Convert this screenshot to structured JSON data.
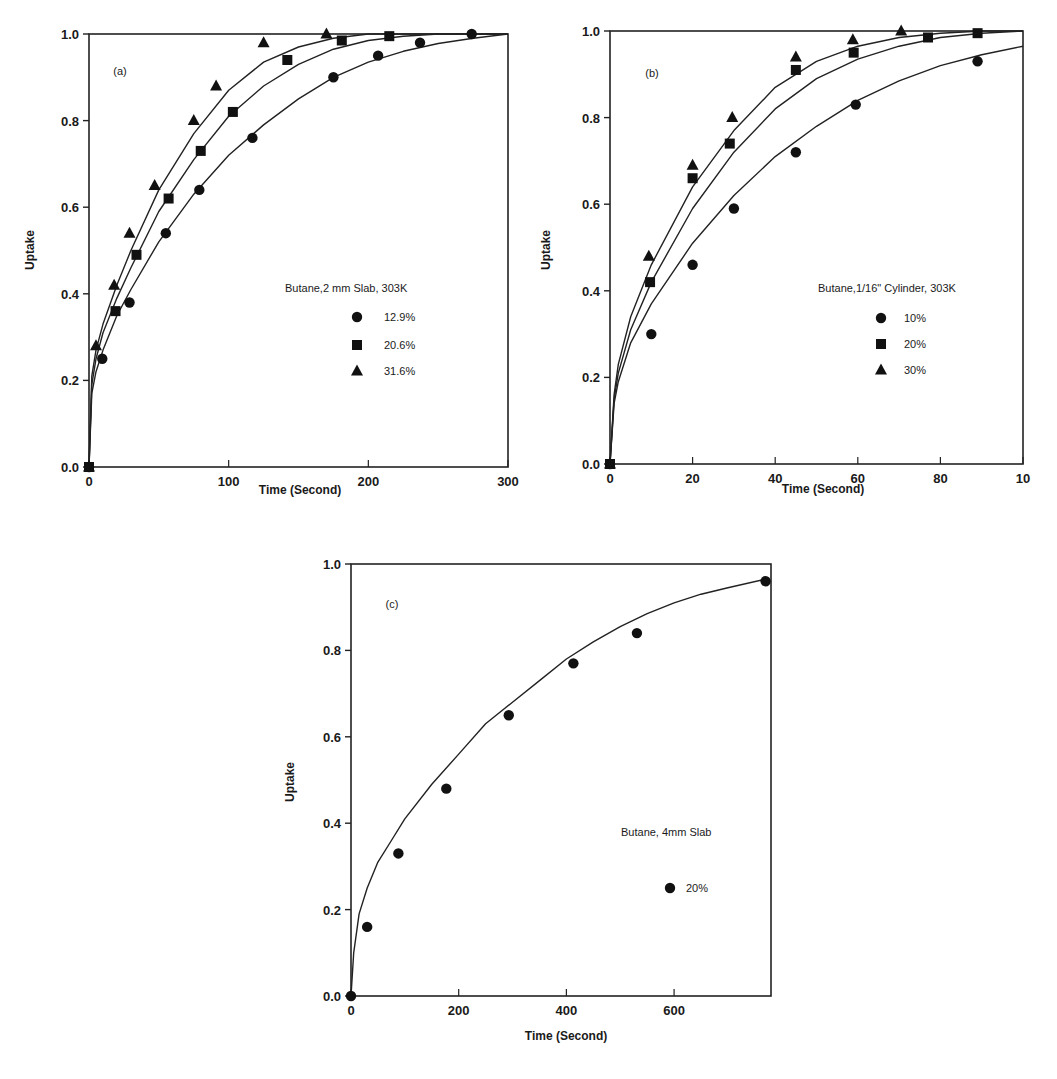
{
  "chart_data": [
    {
      "id": "a",
      "type": "scatter",
      "panel_label": "(a)",
      "title": "",
      "legend_title": "Butane,2 mm Slab, 303K",
      "xlabel": "Time (Second)",
      "ylabel": "Uptake",
      "xlim": [
        0,
        300
      ],
      "ylim": [
        0,
        1.0
      ],
      "xticks": [
        0,
        100,
        200,
        300
      ],
      "xtick_labels": [
        "0",
        "100",
        "200",
        "300"
      ],
      "yticks": [
        0,
        0.2,
        0.4,
        0.6,
        0.8,
        1.0
      ],
      "ytick_labels": [
        "0.0",
        "0.2",
        "0.4",
        "0.6",
        "0.8",
        "1.0"
      ],
      "grid": false,
      "legend_position": "center-right",
      "fit_curves": true,
      "series": [
        {
          "name": "12.9%",
          "marker": "circle",
          "x": [
            0,
            9.5,
            29,
            55,
            79,
            117,
            175,
            207,
            237,
            274
          ],
          "y": [
            0,
            0.25,
            0.38,
            0.54,
            0.64,
            0.76,
            0.9,
            0.95,
            0.98,
            1.0
          ],
          "fit": {
            "x": [
              0,
              2,
              5,
              10,
              20,
              30,
              50,
              75,
              100,
              125,
              150,
              175,
              200,
              225,
              250,
              275,
              300
            ],
            "y": [
              0,
              0.17,
              0.22,
              0.27,
              0.35,
              0.41,
              0.52,
              0.63,
              0.72,
              0.79,
              0.85,
              0.9,
              0.935,
              0.96,
              0.978,
              0.99,
              1.0
            ]
          }
        },
        {
          "name": "20.6%",
          "marker": "square",
          "x": [
            0,
            19,
            34,
            57,
            80,
            103,
            142,
            181,
            215
          ],
          "y": [
            0,
            0.36,
            0.49,
            0.62,
            0.73,
            0.82,
            0.94,
            0.985,
            0.995
          ],
          "fit": {
            "x": [
              0,
              2,
              5,
              10,
              20,
              30,
              50,
              75,
              100,
              125,
              150,
              175,
              200,
              225,
              250,
              275,
              300
            ],
            "y": [
              0,
              0.19,
              0.25,
              0.31,
              0.39,
              0.46,
              0.59,
              0.71,
              0.81,
              0.88,
              0.93,
              0.965,
              0.985,
              0.995,
              1.0,
              1.0,
              1.0
            ]
          }
        },
        {
          "name": "31.6%",
          "marker": "triangle",
          "x": [
            0,
            5,
            18,
            29,
            47,
            75,
            91,
            125,
            170
          ],
          "y": [
            0,
            0.28,
            0.42,
            0.54,
            0.65,
            0.8,
            0.88,
            0.98,
            1.0
          ],
          "fit": {
            "x": [
              0,
              2,
              5,
              10,
              20,
              30,
              50,
              75,
              100,
              125,
              150,
              175,
              200,
              225,
              250,
              275,
              300
            ],
            "y": [
              0,
              0.21,
              0.27,
              0.33,
              0.42,
              0.5,
              0.64,
              0.77,
              0.87,
              0.935,
              0.97,
              0.99,
              1.0,
              1.0,
              1.0,
              1.0,
              1.0
            ]
          }
        }
      ]
    },
    {
      "id": "b",
      "type": "scatter",
      "panel_label": "(b)",
      "title": "",
      "legend_title": "Butane,1/16\" Cylinder, 303K",
      "xlabel": "Time (Second)",
      "ylabel": "Uptake",
      "xlim": [
        0,
        100
      ],
      "ylim": [
        0,
        1.0
      ],
      "xticks": [
        0,
        20,
        40,
        60,
        80,
        100
      ],
      "xtick_labels": [
        "0",
        "20",
        "40",
        "60",
        "80",
        "10"
      ],
      "yticks": [
        0,
        0.2,
        0.4,
        0.6,
        0.8,
        1.0
      ],
      "ytick_labels": [
        "0.0",
        "0.2",
        "0.4",
        "0.6",
        "0.8",
        "1.0"
      ],
      "grid": false,
      "legend_position": "center-right",
      "fit_curves": true,
      "series": [
        {
          "name": "10%",
          "marker": "circle",
          "x": [
            0,
            10,
            20,
            30,
            45,
            59.5,
            89
          ],
          "y": [
            0,
            0.3,
            0.46,
            0.59,
            0.72,
            0.83,
            0.93
          ],
          "fit": {
            "x": [
              0,
              1,
              2,
              5,
              10,
              20,
              30,
              40,
              50,
              60,
              70,
              80,
              90,
              100
            ],
            "y": [
              0,
              0.14,
              0.19,
              0.28,
              0.37,
              0.51,
              0.62,
              0.71,
              0.78,
              0.84,
              0.885,
              0.92,
              0.945,
              0.965
            ]
          }
        },
        {
          "name": "20%",
          "marker": "square",
          "x": [
            0,
            9.7,
            20,
            29,
            45,
            59,
            77,
            89
          ],
          "y": [
            0,
            0.42,
            0.66,
            0.74,
            0.91,
            0.95,
            0.985,
            0.995
          ],
          "fit": {
            "x": [
              0,
              1,
              2,
              5,
              10,
              20,
              30,
              40,
              50,
              60,
              70,
              80,
              90,
              100
            ],
            "y": [
              0,
              0.15,
              0.21,
              0.31,
              0.42,
              0.59,
              0.72,
              0.82,
              0.89,
              0.935,
              0.965,
              0.985,
              0.995,
              1.0
            ]
          }
        },
        {
          "name": "30%",
          "marker": "triangle",
          "x": [
            0,
            9.4,
            20,
            29.6,
            45,
            58.8,
            70.5
          ],
          "y": [
            0,
            0.48,
            0.69,
            0.8,
            0.94,
            0.98,
            1.0
          ],
          "fit": {
            "x": [
              0,
              1,
              2,
              5,
              10,
              20,
              30,
              40,
              50,
              60,
              70,
              80,
              90,
              100
            ],
            "y": [
              0,
              0.16,
              0.23,
              0.34,
              0.46,
              0.64,
              0.77,
              0.87,
              0.93,
              0.965,
              0.985,
              0.995,
              1.0,
              1.0
            ]
          }
        }
      ]
    },
    {
      "id": "c",
      "type": "scatter",
      "panel_label": "(c)",
      "title": "",
      "legend_title": "Butane, 4mm Slab",
      "xlabel": "Time (Second)",
      "ylabel": "Uptake",
      "xlim": [
        0,
        780
      ],
      "ylim": [
        0,
        1.0
      ],
      "xticks": [
        0,
        200,
        400,
        600
      ],
      "xtick_labels": [
        "0",
        "200",
        "400",
        "600"
      ],
      "yticks": [
        0,
        0.2,
        0.4,
        0.6,
        0.8,
        1.0
      ],
      "ytick_labels": [
        "0.0",
        "0.2",
        "0.4",
        "0.6",
        "0.8",
        "1.0"
      ],
      "grid": false,
      "legend_position": "center-right",
      "fit_curves": true,
      "series": [
        {
          "name": "20%",
          "marker": "circle",
          "x": [
            0,
            30,
            88,
            177,
            293,
            413,
            531,
            770
          ],
          "y": [
            0,
            0.16,
            0.33,
            0.48,
            0.65,
            0.77,
            0.84,
            0.96
          ],
          "fit": {
            "x": [
              0,
              5,
              15,
              30,
              50,
              75,
              100,
              150,
              200,
              250,
              300,
              350,
              400,
              450,
              500,
              550,
              600,
              650,
              700,
              770
            ],
            "y": [
              0,
              0.1,
              0.19,
              0.25,
              0.31,
              0.36,
              0.41,
              0.49,
              0.56,
              0.63,
              0.68,
              0.73,
              0.78,
              0.82,
              0.855,
              0.885,
              0.91,
              0.93,
              0.945,
              0.965
            ]
          }
        }
      ]
    }
  ]
}
